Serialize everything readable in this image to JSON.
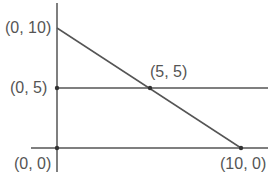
{
  "diagram": {
    "type": "coordinate-graph",
    "labels": {
      "p010": "(0, 10)",
      "p05": "(0, 5)",
      "p55": "(5, 5)",
      "p00": "(0, 0)",
      "p100": "(10, 0)"
    },
    "lines": [
      {
        "name": "descending-line",
        "from": [
          0,
          10
        ],
        "to": [
          10,
          0
        ]
      },
      {
        "name": "horizontal-line-y5",
        "y": 5
      },
      {
        "name": "x-axis",
        "y": 0
      },
      {
        "name": "y-axis",
        "x": 0
      }
    ],
    "points": [
      [
        0,
        10
      ],
      [
        0,
        5
      ],
      [
        5,
        5
      ],
      [
        0,
        0
      ],
      [
        10,
        0
      ]
    ],
    "colors": {
      "line": "#555555",
      "text": "#555555"
    }
  }
}
